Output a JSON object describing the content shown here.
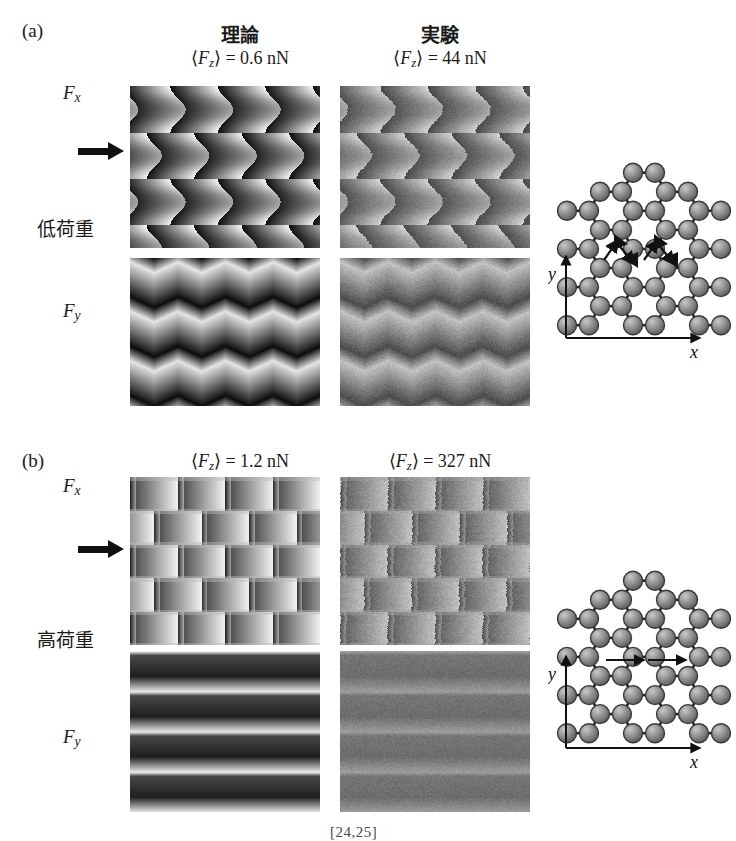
{
  "figure": {
    "type": "friction-force-map-figure",
    "reference_note": "[24,25]"
  },
  "panels": [
    {
      "letter": "(a)",
      "load_label": "低荷重",
      "load_label_meaning": "low load",
      "row_labels": [
        "Fx",
        "Fy"
      ],
      "scan_arrow": "scan-direction-arrow",
      "columns": [
        {
          "heading": "理論",
          "heading_meaning": "theory",
          "value_label": "⟨Fz⟩ = 0.6 nN",
          "avg_normal_force": 0.6,
          "unit": "nN"
        },
        {
          "heading": "実験",
          "heading_meaning": "experiment",
          "value_label": "⟨Fz⟩ = 44 nN",
          "avg_normal_force": 44,
          "unit": "nN"
        }
      ],
      "lattice": {
        "x_axis_label": "x",
        "y_axis_label": "y",
        "path": "zigzag"
      }
    },
    {
      "letter": "(b)",
      "load_label": "高荷重",
      "load_label_meaning": "high load",
      "row_labels": [
        "Fx",
        "Fy"
      ],
      "scan_arrow": "scan-direction-arrow",
      "columns": [
        {
          "heading": "",
          "heading_meaning": "theory",
          "value_label": "⟨Fz⟩ = 1.2 nN",
          "avg_normal_force": 1.2,
          "unit": "nN"
        },
        {
          "heading": "",
          "heading_meaning": "experiment",
          "value_label": "⟨Fz⟩ = 327 nN",
          "avg_normal_force": 327,
          "unit": "nN"
        }
      ],
      "lattice": {
        "x_axis_label": "x",
        "y_axis_label": "y",
        "path": "straight"
      }
    }
  ],
  "chart_data": {
    "type": "heatmap",
    "title": "",
    "xlabel": "x",
    "ylabel": "y",
    "colormap": "grayscale",
    "maps": [
      {
        "id": "a-theory-fx",
        "panel": "(a)",
        "column": "理論",
        "component": "Fx",
        "load": 0.6,
        "unit": "nN",
        "lattice_period_x": 4.0,
        "lattice_period_y": 3.5,
        "pattern": "honeycomb-stick-slip",
        "noise": 0.0
      },
      {
        "id": "a-exper-fx",
        "panel": "(a)",
        "column": "実験",
        "component": "Fx",
        "load": 44,
        "unit": "nN",
        "lattice_period_x": 4.0,
        "lattice_period_y": 3.5,
        "pattern": "honeycomb-stick-slip",
        "noise": 0.22
      },
      {
        "id": "a-theory-fy",
        "panel": "(a)",
        "column": "理論",
        "component": "Fy",
        "load": 0.6,
        "unit": "nN",
        "lattice_period_x": 4.0,
        "lattice_period_y": 3.0,
        "pattern": "zigzag-bands",
        "noise": 0.0
      },
      {
        "id": "a-exper-fy",
        "panel": "(a)",
        "column": "実験",
        "component": "Fy",
        "load": 44,
        "unit": "nN",
        "lattice_period_x": 4.0,
        "lattice_period_y": 3.0,
        "pattern": "zigzag-bands",
        "noise": 0.28
      },
      {
        "id": "b-theory-fx",
        "panel": "(b)",
        "column": "理論",
        "component": "Fx",
        "load": 1.2,
        "unit": "nN",
        "lattice_period_x": 4.0,
        "lattice_period_y": 5.0,
        "pattern": "brick-stick-slip",
        "noise": 0.0
      },
      {
        "id": "b-exper-fx",
        "panel": "(b)",
        "column": "実験",
        "component": "Fx",
        "load": 327,
        "unit": "nN",
        "lattice_period_x": 4.0,
        "lattice_period_y": 5.0,
        "pattern": "brick-stick-slip",
        "noise": 0.3
      },
      {
        "id": "b-theory-fy",
        "panel": "(b)",
        "column": "理論",
        "component": "Fy",
        "load": 1.2,
        "unit": "nN",
        "lattice_period_x": 1.0,
        "lattice_period_y": 4.0,
        "pattern": "horizontal-bands",
        "noise": 0.0
      },
      {
        "id": "b-exper-fy",
        "panel": "(b)",
        "column": "実験",
        "component": "Fy",
        "load": 327,
        "unit": "nN",
        "lattice_period_x": 1.0,
        "lattice_period_y": 4.0,
        "pattern": "horizontal-bands-faint",
        "noise": 0.18
      }
    ]
  }
}
